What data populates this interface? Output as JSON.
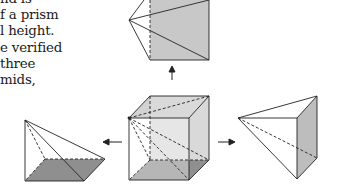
{
  "text": {
    "lines": [
      "nd is",
      "f a prism",
      "l height.",
      "e verified",
      " three",
      "mids,"
    ]
  },
  "figure": {
    "colors": {
      "stroke": "#222222",
      "shade": "#bdbdbd",
      "dark_shade": "#8f8f8f",
      "light_shade": "#d6d6d6"
    },
    "parts": [
      {
        "id": "top-pyramid",
        "arrow": "up"
      },
      {
        "id": "center-cube",
        "arrow": "none"
      },
      {
        "id": "left-pyramid",
        "arrow": "left"
      },
      {
        "id": "right-pyramid",
        "arrow": "right"
      }
    ]
  }
}
